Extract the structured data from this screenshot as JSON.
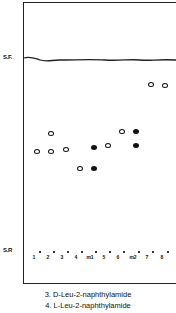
{
  "diagram": {
    "type": "thin-layer-chromatogram",
    "solvent_front_label": "S.F.",
    "start_label": "S.R",
    "lanes": [
      "1",
      "2",
      "3",
      "4",
      "m1",
      "5",
      "6",
      "m2",
      "7",
      "8"
    ],
    "lane_x": [
      37,
      51,
      65,
      79,
      93,
      107,
      121,
      136,
      150,
      165
    ],
    "spots": [
      {
        "lane": "1",
        "x": 37,
        "y": 151,
        "style": "open"
      },
      {
        "lane": "2",
        "x": 51,
        "y": 133,
        "style": "open"
      },
      {
        "lane": "2",
        "x": 51,
        "y": 151,
        "style": "open"
      },
      {
        "lane": "3",
        "x": 66,
        "y": 149,
        "style": "open"
      },
      {
        "lane": "4",
        "x": 80,
        "y": 168,
        "style": "open"
      },
      {
        "lane": "m1",
        "x": 94,
        "y": 147,
        "style": "filled"
      },
      {
        "lane": "m1",
        "x": 94,
        "y": 168,
        "style": "filled"
      },
      {
        "lane": "5",
        "x": 108,
        "y": 145,
        "style": "open"
      },
      {
        "lane": "6",
        "x": 122,
        "y": 131,
        "style": "open"
      },
      {
        "lane": "m2",
        "x": 136,
        "y": 131,
        "style": "filled"
      },
      {
        "lane": "m2",
        "x": 136,
        "y": 145,
        "style": "filled"
      },
      {
        "lane": "7",
        "x": 151,
        "y": 84,
        "style": "open"
      },
      {
        "lane": "8",
        "x": 165,
        "y": 85,
        "style": "open"
      }
    ]
  },
  "captions": [
    "3.  D-Leu-2-naphthylamide",
    "4.  L-Leu-2-naphthylamide"
  ]
}
